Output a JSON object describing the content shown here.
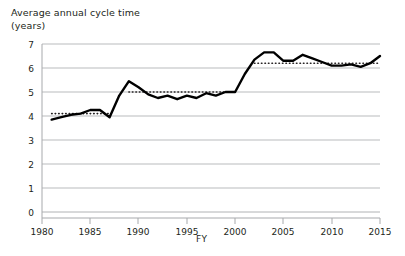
{
  "chart_data": {
    "type": "line",
    "title_line1": "Average annual cycle time",
    "title_line2": "(years)",
    "xlabel": "FY",
    "ylabel": "",
    "xlim": [
      1980,
      2015
    ],
    "ylim": [
      0,
      7
    ],
    "grid": true,
    "grid_axis": "y",
    "legend": "none",
    "x_tick_labels": [
      "1980",
      "1985",
      "1990",
      "1995",
      "2000",
      "2005",
      "2010",
      "2015"
    ],
    "x_ticks": [
      1980,
      1985,
      1990,
      1995,
      2000,
      2005,
      2010,
      2015
    ],
    "y_tick_labels": [
      "0",
      "1",
      "2",
      "3",
      "4",
      "5",
      "6",
      "7"
    ],
    "y_ticks": [
      0,
      1,
      2,
      3,
      4,
      5,
      6,
      7
    ],
    "series": [
      {
        "name": "Average annual cycle time",
        "color": "#000000",
        "x": [
          1981,
          1982,
          1983,
          1984,
          1985,
          1986,
          1987,
          1988,
          1989,
          1990,
          1991,
          1992,
          1993,
          1994,
          1995,
          1996,
          1997,
          1998,
          1999,
          2000,
          2001,
          2002,
          2003,
          2004,
          2005,
          2006,
          2007,
          2008,
          2009,
          2010,
          2011,
          2012,
          2013,
          2014,
          2015
        ],
        "values": [
          3.85,
          3.95,
          4.05,
          4.1,
          4.25,
          4.25,
          3.95,
          4.85,
          5.45,
          5.2,
          4.9,
          4.75,
          4.85,
          4.7,
          4.85,
          4.75,
          4.95,
          4.85,
          5.0,
          5.0,
          5.75,
          6.35,
          6.65,
          6.65,
          6.3,
          6.3,
          6.55,
          6.4,
          6.25,
          6.1,
          6.1,
          6.15,
          6.05,
          6.2,
          6.5
        ]
      }
    ],
    "reference_lines": [
      {
        "name": "era-1-average",
        "value": 4.1,
        "x_start": 1981,
        "x_end": 1987,
        "style": "dotted",
        "color": "#231f20"
      },
      {
        "name": "era-2-average",
        "value": 5.0,
        "x_start": 1989,
        "x_end": 2000,
        "style": "dotted",
        "color": "#231f20"
      },
      {
        "name": "era-3-average",
        "value": 6.2,
        "x_start": 2002,
        "x_end": 2015,
        "style": "dotted",
        "color": "#231f20"
      }
    ]
  }
}
